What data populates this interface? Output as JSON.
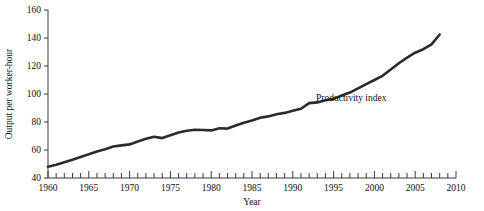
{
  "chart_data": {
    "type": "line",
    "title": "",
    "xlabel": "Year",
    "ylabel": "Output per worker-hour",
    "xlim": [
      1960,
      2010
    ],
    "ylim": [
      40,
      160
    ],
    "ytick_values": [
      40,
      60,
      80,
      100,
      120,
      140,
      160
    ],
    "ytick_labels": [
      "40",
      "60",
      "80",
      "100",
      "120",
      "140",
      "160"
    ],
    "ytick_step": 20,
    "xtick_labels": [
      "1960",
      "1965",
      "1970",
      "1975",
      "1980",
      "1985",
      "1990",
      "1995",
      "2000",
      "2005",
      "2010"
    ],
    "xtick_label_step": 5,
    "xtick_minor_step": 1,
    "grid": false,
    "legend": null,
    "annotations": [
      {
        "text": "Productivity index",
        "x": 1993.3,
        "y": 93.5
      }
    ],
    "series": [
      {
        "name": "Productivity index",
        "color": "#2b2b2b",
        "x": [
          1960,
          1961,
          1962,
          1963,
          1964,
          1965,
          1966,
          1967,
          1968,
          1969,
          1970,
          1971,
          1972,
          1973,
          1974,
          1975,
          1976,
          1977,
          1978,
          1979,
          1980,
          1981,
          1982,
          1983,
          1984,
          1985,
          1986,
          1987,
          1988,
          1989,
          1990,
          1991,
          1992,
          1993,
          1994,
          1995,
          1996,
          1997,
          1998,
          1999,
          2000,
          2001,
          2002,
          2003,
          2004,
          2005,
          2006,
          2007,
          2008
        ],
        "values": [
          48.0,
          49.5,
          51.2,
          53.0,
          55.0,
          57.0,
          59.0,
          60.5,
          62.5,
          63.3,
          64.0,
          66.0,
          68.0,
          69.5,
          68.5,
          70.5,
          72.5,
          73.8,
          74.5,
          74.3,
          74.0,
          75.5,
          75.3,
          77.5,
          79.5,
          81.0,
          83.0,
          84.0,
          85.5,
          86.5,
          88.0,
          89.5,
          93.5,
          94.0,
          95.5,
          96.5,
          99.0,
          101.0,
          104.0,
          107.0,
          110.0,
          113.0,
          117.5,
          122.0,
          126.0,
          129.5,
          132.0,
          135.5,
          142.5
        ]
      }
    ]
  }
}
